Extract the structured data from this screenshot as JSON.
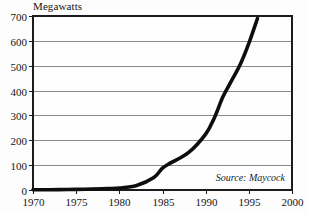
{
  "chart_data": {
    "type": "line",
    "title": "Megawatts",
    "xlabel": "",
    "ylabel": "",
    "xlim": [
      1970,
      2000
    ],
    "ylim": [
      0,
      700
    ],
    "grid": true,
    "legend_position": "none",
    "annotations": [
      {
        "name": "source-note",
        "text": "Source: Maycock",
        "position": "bottom-right-inside-plot",
        "style": "italic"
      }
    ],
    "x_tick_labels": [
      "1970",
      "1975",
      "1980",
      "1985",
      "1990",
      "1995",
      "2000"
    ],
    "x_tick_values": [
      1970,
      1975,
      1980,
      1985,
      1990,
      1995,
      2000
    ],
    "y_tick_labels": [
      "0",
      "100",
      "200",
      "300",
      "400",
      "500",
      "600",
      "700"
    ],
    "y_tick_values": [
      0,
      100,
      200,
      300,
      400,
      500,
      600,
      700
    ],
    "series": [
      {
        "name": "Megawatts",
        "color": "#0d0d0d",
        "x": [
          1970,
          1972,
          1974,
          1976,
          1978,
          1980,
          1982,
          1984,
          1985,
          1986,
          1988,
          1990,
          1991,
          1992,
          1993,
          1994,
          1995,
          1996
        ],
        "values": [
          1,
          1,
          2,
          3,
          5,
          8,
          18,
          50,
          88,
          110,
          150,
          225,
          290,
          375,
          440,
          505,
          590,
          690
        ]
      }
    ]
  }
}
